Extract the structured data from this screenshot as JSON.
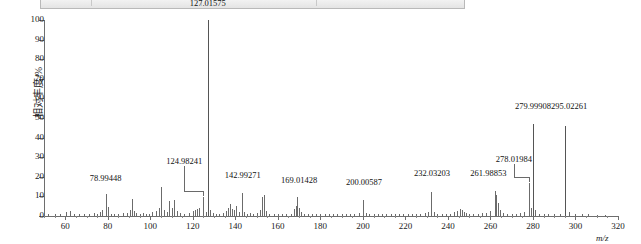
{
  "window_strip": {
    "note": "partially cut-off toolbar row at top of screenshot",
    "ghost_texts": [
      "",
      "",
      "",
      ""
    ]
  },
  "chart_data": {
    "type": "bar",
    "title": "",
    "subtitle": "",
    "xlabel": "m/z",
    "ylabel": "相对丰度/%",
    "xlim": [
      50,
      320
    ],
    "ylim": [
      0,
      100
    ],
    "grid": false,
    "legend": null,
    "xticks": [
      60,
      80,
      100,
      120,
      140,
      160,
      180,
      200,
      220,
      240,
      260,
      280,
      300,
      320
    ],
    "xtick_labels": [
      "60",
      "80",
      "100",
      "120",
      "140",
      "160",
      "180",
      "200",
      "220",
      "240",
      "260",
      "280",
      "300",
      "320"
    ],
    "yticks": [
      0,
      10,
      20,
      30,
      40,
      50,
      60,
      70,
      80,
      90,
      100
    ],
    "ytick_labels": [
      "0",
      "10",
      "20",
      "30",
      "40",
      "50",
      "60",
      "70",
      "80",
      "90",
      "100"
    ],
    "x": [
      52.0,
      55.0,
      57.5,
      60.5,
      62.0,
      64.0,
      66.5,
      69.0,
      71.0,
      73.5,
      75.0,
      76.5,
      77.5,
      78.99448,
      80.0,
      81.5,
      83.0,
      85.0,
      87.0,
      89.0,
      90.5,
      91.5,
      92.5,
      93.5,
      95.0,
      96.5,
      98.0,
      99.5,
      101.0,
      102.5,
      104.0,
      105.0,
      106.5,
      108.0,
      109.0,
      110.0,
      111.0,
      112.5,
      114.0,
      116.0,
      118.0,
      120.0,
      121.0,
      122.0,
      123.0,
      124.98241,
      126.0,
      127.01575,
      128.0,
      129.5,
      131.0,
      132.5,
      134.0,
      135.5,
      136.5,
      137.5,
      138.5,
      139.5,
      140.5,
      141.5,
      142.99271,
      144.0,
      145.5,
      147.0,
      148.5,
      150.0,
      151.5,
      152.5,
      153.5,
      154.5,
      156.0,
      158.0,
      160.0,
      162.0,
      164.0,
      166.0,
      167.5,
      168.5,
      169.01428,
      170.0,
      171.0,
      172.5,
      174.0,
      176.0,
      178.0,
      180.0,
      182.0,
      184.0,
      186.0,
      188.0,
      190.0,
      192.0,
      194.0,
      196.0,
      198.0,
      200.00587,
      201.5,
      203.0,
      205.0,
      207.0,
      209.0,
      211.0,
      213.0,
      215.0,
      217.0,
      219.0,
      221.0,
      223.0,
      225.0,
      227.0,
      229.0,
      230.5,
      232.03203,
      233.5,
      235.0,
      237.0,
      239.0,
      241.0,
      243.0,
      244.5,
      245.5,
      246.5,
      247.5,
      248.5,
      250.0,
      252.0,
      254.0,
      256.0,
      258.0,
      260.0,
      261.98853,
      262.8,
      263.6,
      264.5,
      266.0,
      268.0,
      270.0,
      272.0,
      274.0,
      276.0,
      278.01984,
      278.9,
      279.99908,
      281.0,
      283.0,
      285.0,
      287.0,
      290.0,
      292.5,
      295.02261,
      297.0,
      300.0,
      303.0,
      306.0,
      310.0,
      314.0
    ],
    "y": [
      1.2,
      1.0,
      0.8,
      2.0,
      2.6,
      1.0,
      1.2,
      0.8,
      1.0,
      1.4,
      1.0,
      2.2,
      3.0,
      11.0,
      4.5,
      1.2,
      1.0,
      1.2,
      1.6,
      1.4,
      3.0,
      8.5,
      2.4,
      1.6,
      1.2,
      1.6,
      1.0,
      1.2,
      1.8,
      2.6,
      4.0,
      15.0,
      3.0,
      2.2,
      7.5,
      4.0,
      8.0,
      2.4,
      1.6,
      1.2,
      1.4,
      2.6,
      3.2,
      3.6,
      4.2,
      9.5,
      1.8,
      100.0,
      3.2,
      1.4,
      1.2,
      1.0,
      1.6,
      2.8,
      4.0,
      6.0,
      3.6,
      3.0,
      5.0,
      2.2,
      11.5,
      2.0,
      1.2,
      1.4,
      1.2,
      1.6,
      3.0,
      9.5,
      10.5,
      2.6,
      1.2,
      1.0,
      0.8,
      1.0,
      1.0,
      1.2,
      3.6,
      5.2,
      9.5,
      4.0,
      2.0,
      1.2,
      1.0,
      0.8,
      1.0,
      1.2,
      1.0,
      0.8,
      1.0,
      0.8,
      1.0,
      0.8,
      1.0,
      1.2,
      1.4,
      8.0,
      1.6,
      1.0,
      0.8,
      1.0,
      0.8,
      1.0,
      0.8,
      1.0,
      0.8,
      1.0,
      0.8,
      1.0,
      1.2,
      1.0,
      1.4,
      1.8,
      12.5,
      2.0,
      1.2,
      1.0,
      0.8,
      1.0,
      1.8,
      2.8,
      3.6,
      3.0,
      2.2,
      1.6,
      1.2,
      1.0,
      1.2,
      1.4,
      1.6,
      2.4,
      13.0,
      10.5,
      6.5,
      3.0,
      1.4,
      1.2,
      1.0,
      1.2,
      1.4,
      2.2,
      17.0,
      4.0,
      47.0,
      3.0,
      1.2,
      1.0,
      0.8,
      0.8,
      1.0,
      46.0,
      2.0,
      1.0,
      0.8,
      0.8,
      0.6,
      0.6
    ],
    "labeled_peaks": [
      {
        "mz": "78.99448",
        "x": 78.99448,
        "y": 11.0,
        "label_x": 78.99448,
        "label_y": 17.0,
        "leader": false
      },
      {
        "mz": "124.98241",
        "x": 124.98241,
        "y": 9.5,
        "label_x": 116.0,
        "label_y": 25.5,
        "leader": true
      },
      {
        "mz": "127.01575",
        "x": 127.01575,
        "y": 100.0,
        "label_x": 127.01575,
        "label_y": 106.0,
        "leader": false
      },
      {
        "mz": "142.99271",
        "x": 142.99271,
        "y": 11.5,
        "label_x": 143.5,
        "label_y": 18.5,
        "leader": false
      },
      {
        "mz": "169.01428",
        "x": 169.01428,
        "y": 9.5,
        "label_x": 170.0,
        "label_y": 16.0,
        "leader": false
      },
      {
        "mz": "200.00587",
        "x": 200.00587,
        "y": 8.0,
        "label_x": 200.5,
        "label_y": 15.0,
        "leader": false
      },
      {
        "mz": "232.03203",
        "x": 232.03203,
        "y": 12.5,
        "label_x": 232.5,
        "label_y": 19.5,
        "leader": false
      },
      {
        "mz": "261.98853",
        "x": 261.98853,
        "y": 13.0,
        "label_x": 259.0,
        "label_y": 19.5,
        "leader": false
      },
      {
        "mz": "278.01984",
        "x": 278.01984,
        "y": 17.0,
        "label_x": 271.0,
        "label_y": 26.5,
        "leader": true
      },
      {
        "mz": "279.99908",
        "x": 279.99908,
        "y": 47.0,
        "label_x": 280.0,
        "label_y": 53.5,
        "leader": false
      },
      {
        "mz": "295.02261",
        "x": 295.02261,
        "y": 46.0,
        "label_x": 297.0,
        "label_y": 53.5,
        "leader": false
      }
    ]
  }
}
